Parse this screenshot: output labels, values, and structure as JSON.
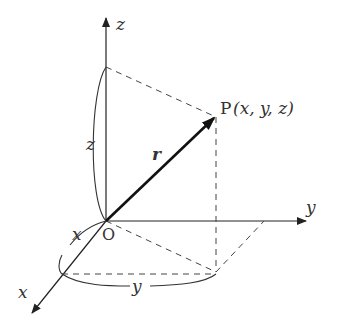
{
  "diagram": {
    "axes": {
      "x_label": "x",
      "y_label": "y",
      "z_label": "z"
    },
    "origin_label": "O",
    "vector_label": "r",
    "point": {
      "name": "P",
      "coords": "(x, y, z)",
      "x": "x",
      "y": "y",
      "z": "z"
    },
    "dimension_labels": {
      "z_height": "z",
      "x_length": "x",
      "y_length": "y"
    },
    "colors": {
      "line": "#222222",
      "dashed": "#444444",
      "text": "#333333"
    }
  }
}
